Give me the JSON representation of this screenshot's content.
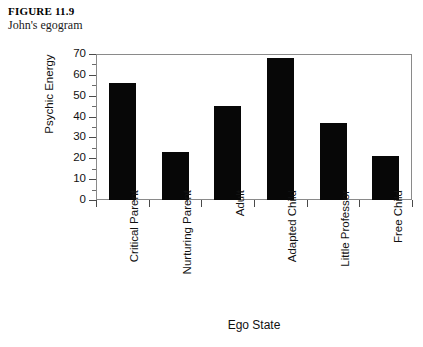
{
  "caption": {
    "figure_number": "FIGURE 11.9",
    "title": "John's egogram"
  },
  "chart_data": {
    "type": "bar",
    "title": "John's egogram",
    "xlabel": "Ego State",
    "ylabel": "Psychic Energy",
    "categories": [
      "Critical Parent",
      "Nurturing Parent",
      "Adult",
      "Adapted Child",
      "Little Professor",
      "Free Child"
    ],
    "values": [
      56,
      23,
      45,
      68,
      37,
      21
    ],
    "ylim": [
      0,
      70
    ],
    "yticks": [
      0,
      10,
      20,
      30,
      40,
      50,
      60,
      70
    ],
    "ytick_labels": [
      "0",
      "10",
      "20",
      "30",
      "40",
      "50",
      "60",
      "70"
    ],
    "minor_tick_interval": 5,
    "grid": false,
    "legend": false,
    "bar_color": "#070707",
    "frame_color": "#8a8a8a"
  }
}
